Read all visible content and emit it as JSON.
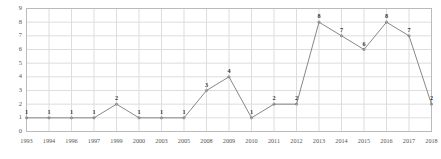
{
  "chart_data": {
    "type": "line",
    "title": "",
    "xlabel": "",
    "ylabel": "",
    "categories": [
      "1993",
      "1994",
      "1996",
      "1997",
      "1999",
      "2000",
      "2003",
      "2005",
      "2008",
      "2009",
      "2010",
      "2011",
      "2012",
      "2013",
      "2014",
      "2015",
      "2016",
      "2017",
      "2018"
    ],
    "values": [
      1,
      1,
      1,
      1,
      2,
      1,
      1,
      1,
      3,
      4,
      1,
      2,
      2,
      8,
      7,
      6,
      8,
      7,
      2
    ],
    "point_labels": [
      "1",
      "1",
      "1",
      "1",
      "2",
      "1",
      "1",
      "1",
      "3",
      "4",
      "1",
      "2",
      "2",
      "8",
      "7",
      "6",
      "8",
      "7",
      "2"
    ],
    "ylim": [
      0,
      9
    ],
    "yticks": [
      "0",
      "1",
      "2",
      "3",
      "4",
      "5",
      "6",
      "7",
      "8",
      "9"
    ],
    "grid": true,
    "legend": false,
    "series": [
      {
        "name": "series-1",
        "values": [
          1,
          1,
          1,
          1,
          2,
          1,
          1,
          1,
          3,
          4,
          1,
          2,
          2,
          8,
          7,
          6,
          8,
          7,
          2
        ]
      }
    ],
    "colors": {
      "line": "#888888",
      "marker": "#777777",
      "grid": "#dddddd",
      "border": "#bbbbbb",
      "tick_text": "#555555",
      "label_text": "#333333",
      "background": "#ffffff"
    }
  }
}
